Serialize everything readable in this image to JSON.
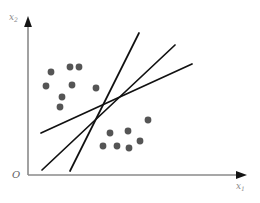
{
  "figure": {
    "background_color": "#ffffff"
  },
  "axes": {
    "origin_label": "O",
    "x_axis": {
      "label_base": "x",
      "label_subscript": "1",
      "label_full": "x₁",
      "color": "#8a8a8a",
      "arrow_color": "#1a1a1a"
    },
    "y_axis": {
      "label_base": "x",
      "label_subscript": "2",
      "label_full": "x₂",
      "color": "#8a8a8a",
      "arrow_color": "#1a1a1a"
    }
  },
  "style": {
    "point_color": "#555555",
    "line_color": "#111111",
    "point_radius": 3.4,
    "line_width": 1.7
  },
  "chart_data": {
    "type": "scatter",
    "title": "",
    "xlabel": "x₁",
    "ylabel": "x₂",
    "grid": false,
    "legend": "none",
    "xlim": [
      0,
      260
    ],
    "ylim": [
      0,
      203
    ],
    "note": "Coordinates are given in screenshot pixel space (y increases downward).",
    "series": [
      {
        "name": "class-upper-left",
        "color": "#555555",
        "marker": "circle",
        "points": [
          {
            "x": 51,
            "y": 72
          },
          {
            "x": 70,
            "y": 67
          },
          {
            "x": 79,
            "y": 67
          },
          {
            "x": 46,
            "y": 86
          },
          {
            "x": 72,
            "y": 85
          },
          {
            "x": 62,
            "y": 97
          },
          {
            "x": 96,
            "y": 88
          },
          {
            "x": 60,
            "y": 107
          }
        ]
      },
      {
        "name": "class-lower-right",
        "color": "#555555",
        "marker": "circle",
        "points": [
          {
            "x": 148,
            "y": 120
          },
          {
            "x": 128,
            "y": 131
          },
          {
            "x": 110,
            "y": 133
          },
          {
            "x": 140,
            "y": 141
          },
          {
            "x": 103,
            "y": 146
          },
          {
            "x": 117,
            "y": 146
          },
          {
            "x": 129,
            "y": 148
          }
        ]
      }
    ],
    "lines": [
      {
        "name": "boundary-steep",
        "color": "#111111",
        "x1": 70,
        "y1": 171,
        "x2": 139,
        "y2": 33
      },
      {
        "name": "boundary-medium",
        "color": "#111111",
        "x1": 42,
        "y1": 170,
        "x2": 175,
        "y2": 45
      },
      {
        "name": "boundary-shallow",
        "color": "#111111",
        "x1": 41,
        "y1": 133,
        "x2": 192,
        "y2": 64
      }
    ],
    "intersection_region": {
      "x": 103,
      "y": 104
    }
  }
}
